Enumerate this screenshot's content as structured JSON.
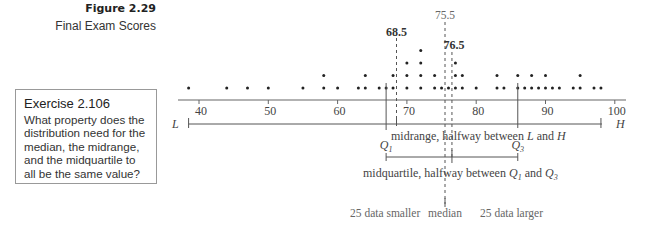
{
  "figure": {
    "label": "Figure 2.29",
    "caption": "Final Exam Scores"
  },
  "exercise": {
    "title": "Exercise 2.106",
    "body": "What property does the distribution need for the median, the midrange, and the midquartile to all be the same value?"
  },
  "chart_data": {
    "type": "scatter",
    "subtype": "dot-plot",
    "title": "Final Exam Scores",
    "xlabel": "",
    "ylabel": "",
    "xlim": [
      38,
      101
    ],
    "x_ticks": [
      40,
      50,
      60,
      70,
      80,
      90,
      100
    ],
    "grid": false,
    "dot_columns": [
      {
        "x": 38.5,
        "count": 1
      },
      {
        "x": 44,
        "count": 1
      },
      {
        "x": 47,
        "count": 1
      },
      {
        "x": 50,
        "count": 1
      },
      {
        "x": 55,
        "count": 1
      },
      {
        "x": 58,
        "count": 2
      },
      {
        "x": 60,
        "count": 1
      },
      {
        "x": 63,
        "count": 1
      },
      {
        "x": 64,
        "count": 2
      },
      {
        "x": 66,
        "count": 1
      },
      {
        "x": 67,
        "count": 1
      },
      {
        "x": 68,
        "count": 2
      },
      {
        "x": 70,
        "count": 3
      },
      {
        "x": 72,
        "count": 4
      },
      {
        "x": 74,
        "count": 2
      },
      {
        "x": 75,
        "count": 1
      },
      {
        "x": 76,
        "count": 1
      },
      {
        "x": 77,
        "count": 3
      },
      {
        "x": 78,
        "count": 2
      },
      {
        "x": 80,
        "count": 1
      },
      {
        "x": 83,
        "count": 2
      },
      {
        "x": 84,
        "count": 1
      },
      {
        "x": 86,
        "count": 2
      },
      {
        "x": 87,
        "count": 1
      },
      {
        "x": 88,
        "count": 2
      },
      {
        "x": 89,
        "count": 1
      },
      {
        "x": 90,
        "count": 2
      },
      {
        "x": 91,
        "count": 1
      },
      {
        "x": 92,
        "count": 1
      },
      {
        "x": 94,
        "count": 1
      },
      {
        "x": 95,
        "count": 2
      },
      {
        "x": 97,
        "count": 1
      },
      {
        "x": 98,
        "count": 1
      }
    ],
    "annotations": {
      "midrange_value": "68.5",
      "median_value": "75.5",
      "midquartile_value": "76.5",
      "L_label": "L",
      "H_label": "H",
      "L_value": 38.5,
      "H_value": 98,
      "Q1_label": "Q",
      "Q1_sub": "1",
      "Q3_label": "Q",
      "Q3_sub": "3",
      "Q1_value": 67,
      "Q3_value": 86,
      "midrange_text_1": "midrange, halfway between ",
      "midrange_text_L": "L",
      "midrange_text_2": " and ",
      "midrange_text_H": "H",
      "midquartile_text_1": "midquartile, halfway between ",
      "midquartile_text_2": " and ",
      "smaller_text": "25 data smaller",
      "median_text": "median",
      "larger_text": "25 data larger"
    }
  }
}
